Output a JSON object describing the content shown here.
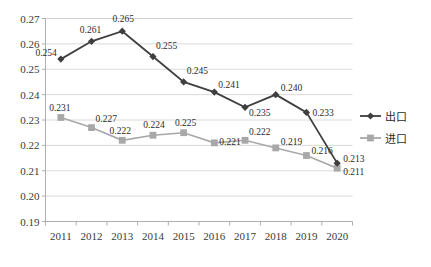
{
  "chart_data": {
    "type": "line",
    "title": "",
    "xlabel": "",
    "ylabel": "",
    "categories": [
      "2011",
      "2012",
      "2013",
      "2014",
      "2015",
      "2016",
      "2017",
      "2018",
      "2019",
      "2020"
    ],
    "ylim": [
      0.19,
      0.27
    ],
    "ytick_labels": [
      "0.27",
      "0.26",
      "0.25",
      "0.24",
      "0.23",
      "0.22",
      "0.21",
      "0.20",
      "0.19"
    ],
    "ytick_values": [
      0.27,
      0.26,
      0.25,
      0.24,
      0.23,
      0.22,
      0.21,
      0.2,
      0.19
    ],
    "grid": true,
    "legend_position": "right",
    "series": [
      {
        "name": "出口",
        "color": "#3f3f3f",
        "marker": "diamond",
        "values": [
          0.254,
          0.261,
          0.265,
          0.255,
          0.245,
          0.241,
          0.235,
          0.24,
          0.233,
          0.213
        ],
        "labels": [
          "0.254",
          "0.261",
          "0.265",
          "0.255",
          "0.245",
          "0.241",
          "0.235",
          "0.240",
          "0.233",
          "0.213"
        ]
      },
      {
        "name": "进口",
        "color": "#a8a8a8",
        "marker": "square",
        "values": [
          0.231,
          0.227,
          0.222,
          0.224,
          0.225,
          0.221,
          0.222,
          0.219,
          0.216,
          0.211
        ],
        "labels": [
          "0.231",
          "0.227",
          "0.222",
          "0.224",
          "0.225",
          "0.221",
          "0.222",
          "0.219",
          "0.216",
          "0.211"
        ]
      }
    ]
  },
  "legend": {
    "items": [
      {
        "label": "出口",
        "color": "#3f3f3f",
        "marker": "diamond"
      },
      {
        "label": "进口",
        "color": "#a8a8a8",
        "marker": "square"
      }
    ]
  },
  "colors": {
    "export_series": "#3f3f3f",
    "import_series": "#a8a8a8",
    "gridline": "#d0d0d0",
    "axis": "#a6a6a6",
    "background": "#ffffff"
  }
}
